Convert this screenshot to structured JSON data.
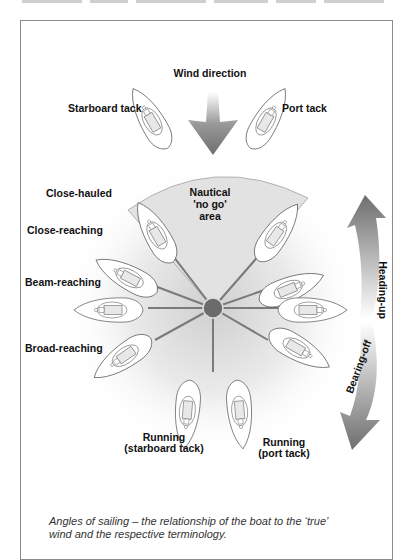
{
  "diagram": {
    "title": "Wind direction",
    "labels": {
      "starboard_tack": "Starboard tack",
      "port_tack": "Port tack",
      "close_hauled": "Close-hauled",
      "close_reaching": "Close-reaching",
      "beam_reaching": "Beam-reaching",
      "broad_reaching": "Broad-reaching",
      "running_starboard_line1": "Running",
      "running_starboard_line2": "(starboard tack)",
      "running_port_line1": "Running",
      "running_port_line2": "(port tack)",
      "no_go_line1": "Nautical",
      "no_go_line2": "'no go'",
      "no_go_line3": "area",
      "heading_up": "Heading-up",
      "bearing_off": "Bearing-off"
    },
    "colors": {
      "arrow_dark": "#6e6e6e",
      "arrow_light": "#e6e6e6",
      "no_go_fill": "#e2e2e2",
      "spoke": "#7a7a7a",
      "hub": "#6b6b6b",
      "frame": "#8a8a8a"
    },
    "icons": [
      "wind-arrow-icon",
      "boat-icon",
      "hub-icon",
      "heading-up-arrow-icon",
      "bearing-off-arrow-icon"
    ]
  },
  "caption": {
    "line1": "Angles of sailing – the relationship of the boat to the ‘true’",
    "line2": "wind and the respective terminology."
  }
}
